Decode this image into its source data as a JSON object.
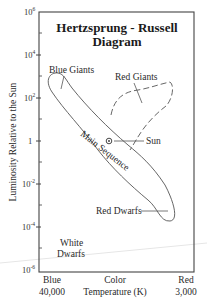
{
  "diagram": {
    "title_line1": "Hertzsprung - Russell",
    "title_line2": "Diagram",
    "y_axis_label": "Luminosity Relative to the Sun",
    "x_axis": {
      "left_label": "Blue",
      "left_value": "40,000",
      "center_label_line1": "Color",
      "center_label_line2": "Temperature (K)",
      "right_label": "Red",
      "right_value": "3,000"
    },
    "y_ticks": [
      {
        "base": "10",
        "exp": "6",
        "y": 12
      },
      {
        "base": "10",
        "exp": "4",
        "y": 55
      },
      {
        "base": "10",
        "exp": "2",
        "y": 98
      },
      {
        "base": "1",
        "exp": "",
        "y": 141
      },
      {
        "base": "10",
        "exp": "-2",
        "y": 184
      },
      {
        "base": "10",
        "exp": "-4",
        "y": 227
      },
      {
        "base": "10",
        "exp": "-6",
        "y": 270
      }
    ],
    "regions": {
      "blue_giants": "Blue Giants",
      "red_giants": "Red Giants",
      "main_sequence": "Main Sequence",
      "sun": "Sun",
      "red_dwarfs": "Red Dwarfs",
      "white_dwarfs_line1": "White",
      "white_dwarfs_line2": "Dwarfs"
    },
    "colors": {
      "line": "#555555",
      "frame": "#444444",
      "text": "#222222"
    }
  }
}
